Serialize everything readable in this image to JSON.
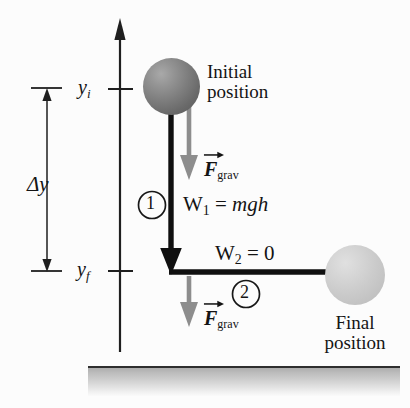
{
  "figure": {
    "background_color": "#fcfcfc"
  },
  "axis": {
    "name": "vertical-position-axis",
    "color": "#1f1f1f",
    "ticks": [
      {
        "id": "y-initial",
        "label_main": "y",
        "label_sub": "i"
      },
      {
        "id": "y-final",
        "label_main": "y",
        "label_sub": "f"
      }
    ]
  },
  "dimension": {
    "name": "delta-y",
    "label": "Δy",
    "style": "double-headed-arrow"
  },
  "objects": [
    {
      "id": "initial-ball",
      "label_line1": "Initial",
      "label_line2": "position",
      "color": "#7d7d7d"
    },
    {
      "id": "final-ball",
      "label_line1": "Final",
      "label_line2": "position",
      "color": "#cbcbcb"
    }
  ],
  "forces": [
    {
      "id": "f-grav-upper",
      "symbol": "F",
      "subscript": "grav",
      "direction": "down",
      "color": "#8a8a8a"
    },
    {
      "id": "f-grav-lower",
      "symbol": "F",
      "subscript": "grav",
      "direction": "down",
      "color": "#8a8a8a"
    }
  ],
  "segments": [
    {
      "id": "segment-1",
      "marker": "1",
      "work_symbol": "W",
      "work_sub": "1",
      "equals": "=",
      "work_value": "mgh",
      "direction": "down",
      "color": "#101010"
    },
    {
      "id": "segment-2",
      "marker": "2",
      "work_symbol": "W",
      "work_sub": "2",
      "equals": "=",
      "work_value": "0",
      "direction": "right",
      "color": "#101010"
    }
  ],
  "ground": {
    "name": "ground-surface",
    "color": "#cecece"
  }
}
